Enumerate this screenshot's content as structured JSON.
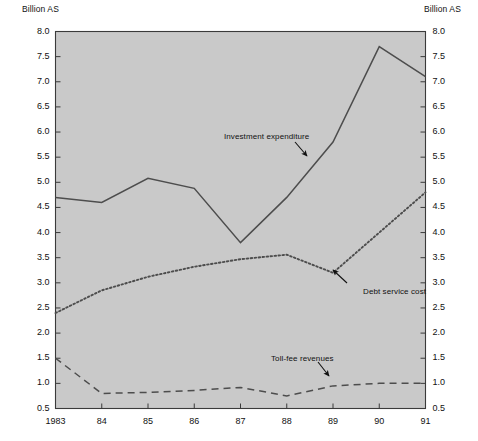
{
  "axis_titles": {
    "left": "Billion AS",
    "right": "Billion AS"
  },
  "chart_data": {
    "type": "line",
    "title": "",
    "subtitle": "",
    "xlabel": "",
    "ylabel": "Billion AS",
    "y2label": "Billion AS",
    "grid": false,
    "legend": "annotations-on-plot",
    "plot_background": "#c9c9c9",
    "categories": [
      "1983",
      "84",
      "85",
      "86",
      "87",
      "88",
      "89",
      "90",
      "91"
    ],
    "x": [
      1983,
      1984,
      1985,
      1986,
      1987,
      1988,
      1989,
      1990,
      1991
    ],
    "ylim": [
      0.5,
      8.0
    ],
    "ytick_step": 0.5,
    "yticks": [
      "0.5",
      "1.0",
      "1.5",
      "2.0",
      "2.5",
      "3.0",
      "3.5",
      "4.0",
      "4.5",
      "5.0",
      "5.5",
      "6.0",
      "6.5",
      "7.0",
      "7.5",
      "8.0"
    ],
    "series": [
      {
        "name": "Investment expenditure",
        "style": "solid",
        "color": "#4d4d4d",
        "values": [
          4.7,
          4.6,
          5.08,
          4.88,
          3.8,
          4.7,
          5.8,
          7.7,
          7.1
        ]
      },
      {
        "name": "Debt service cost",
        "style": "dotted",
        "color": "#4d4d4d",
        "values": [
          2.4,
          2.85,
          3.12,
          3.32,
          3.47,
          3.56,
          3.2,
          4.0,
          4.8
        ]
      },
      {
        "name": "Toll-fee revenues",
        "style": "dashed",
        "color": "#4d4d4d",
        "values": [
          1.5,
          0.8,
          0.82,
          0.86,
          0.92,
          0.75,
          0.95,
          1.0,
          1.0
        ]
      }
    ],
    "annotations": [
      {
        "text": "Investment expenditure",
        "target_x": 1988.2,
        "target_y": 5.55
      },
      {
        "text": "Debt service cost",
        "target_x": 1989.0,
        "target_y": 3.2
      },
      {
        "text": "Toll-fee revenues",
        "target_x": 1989.1,
        "target_y": 0.98
      }
    ]
  }
}
